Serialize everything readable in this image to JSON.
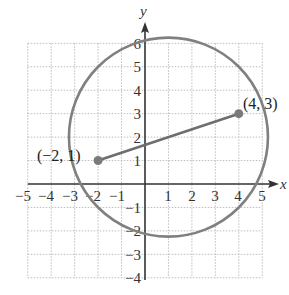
{
  "figure": {
    "type": "coordinate-plane",
    "x_axis": {
      "label": "x",
      "min": -5,
      "max": 5,
      "ticks": [
        "-5",
        "-4",
        "-3",
        "-2",
        "-1",
        "1",
        "2",
        "3",
        "4",
        "5"
      ]
    },
    "y_axis": {
      "label": "y",
      "min": -4,
      "max": 6,
      "ticks": [
        "6",
        "5",
        "4",
        "3",
        "2",
        "1",
        "-1",
        "-2",
        "-3",
        "-4"
      ]
    },
    "grid": true,
    "circle": {
      "center": [
        1,
        2
      ],
      "radius": 4.243,
      "color": "#7a7a7a"
    },
    "segment": {
      "from": [
        -2,
        1
      ],
      "to": [
        4,
        3
      ],
      "color": "#6e6e6e"
    },
    "points": [
      {
        "x": -2,
        "y": 1,
        "label": "(−2, 1)"
      },
      {
        "x": 4,
        "y": 3,
        "label": "(4, 3)"
      }
    ],
    "colors": {
      "grid": "#bdbdbd",
      "axis": "#333333",
      "curve": "#808080"
    }
  },
  "labels": {
    "x_axis_name": "x",
    "y_axis_name": "y",
    "point_a": "(−2, 1)",
    "point_b": "(4, 3)",
    "x_ticks": [
      "−5",
      "−4",
      "−3",
      "−2",
      "−1",
      "1",
      "2",
      "3",
      "4",
      "5"
    ],
    "y_ticks": [
      "6",
      "5",
      "4",
      "3",
      "2",
      "1",
      "−1",
      "−2",
      "−3",
      "−4"
    ]
  }
}
